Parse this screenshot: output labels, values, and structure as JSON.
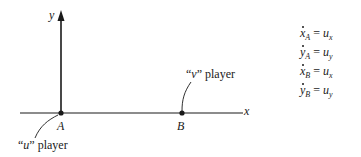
{
  "diagram": {
    "axes": {
      "x_label": "x",
      "y_label": "y"
    },
    "points": [
      {
        "label": "A",
        "description": "“u” player"
      },
      {
        "label": "B",
        "description": "“v” player"
      }
    ],
    "annotations": {
      "u_player_open": "“",
      "u_player_var": "u",
      "u_player_close": "” player",
      "v_player_open": "“",
      "v_player_var": "v",
      "v_player_close": "” player"
    },
    "equations": [
      {
        "lhs_var": "x",
        "lhs_sub": "A",
        "eq": " = ",
        "rhs_var": "u",
        "rhs_sub": "x"
      },
      {
        "lhs_var": "y",
        "lhs_sub": "A",
        "eq": " = ",
        "rhs_var": "u",
        "rhs_sub": "y"
      },
      {
        "lhs_var": "x",
        "lhs_sub": "B",
        "eq": " = ",
        "rhs_var": "u",
        "rhs_sub": "x"
      },
      {
        "lhs_var": "y",
        "lhs_sub": "B",
        "eq": " = ",
        "rhs_var": "u",
        "rhs_sub": "y"
      }
    ],
    "colors": {
      "ink": "#1a1a1a",
      "background": "#ffffff"
    }
  }
}
